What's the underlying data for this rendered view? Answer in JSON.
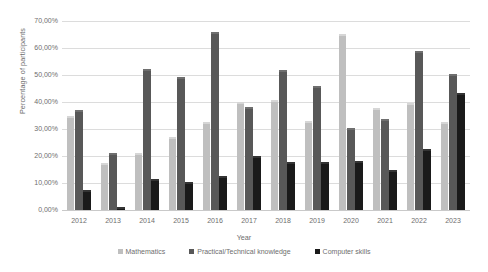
{
  "chart_data": {
    "type": "bar",
    "title": "",
    "xlabel": "Year",
    "ylabel": "Percentage of participants",
    "ylim": [
      0,
      70
    ],
    "ytick_labels": [
      "0,00%",
      "10,00%",
      "20,00%",
      "30,00%",
      "40,00%",
      "50,00%",
      "60,00%",
      "70,00%"
    ],
    "ytick_values": [
      0,
      10,
      20,
      30,
      40,
      50,
      60,
      70
    ],
    "grid": true,
    "legend_position": "bottom",
    "categories": [
      "2012",
      "2013",
      "2014",
      "2015",
      "2016",
      "2017",
      "2018",
      "2019",
      "2020",
      "2021",
      "2022",
      "2023"
    ],
    "series": [
      {
        "name": "Mathematics",
        "color": "#bfbfbf",
        "values": [
          34.0,
          16.5,
          20.3,
          26.2,
          32.0,
          39.2,
          40.0,
          32.2,
          64.5,
          37.0,
          38.8,
          32.0
        ]
      },
      {
        "name": "Practical/Technical knowledge",
        "color": "#585858",
        "values": [
          36.2,
          20.5,
          51.5,
          48.5,
          65.3,
          37.5,
          51.0,
          45.2,
          29.8,
          33.0,
          58.3,
          49.5
        ]
      },
      {
        "name": "Computer skills",
        "color": "#1a1a1a",
        "values": [
          6.5,
          0.3,
          10.7,
          9.6,
          12.0,
          19.3,
          17.0,
          17.0,
          17.3,
          14.0,
          22.0,
          42.5
        ]
      }
    ]
  }
}
